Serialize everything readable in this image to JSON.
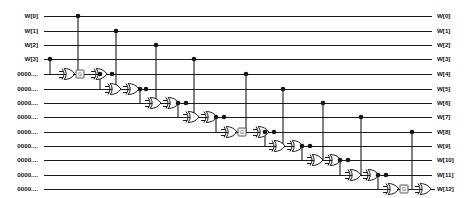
{
  "diagram": {
    "type": "logic-schematic",
    "width": 473,
    "height": 198,
    "colors": {
      "wire": "#1a1a1a",
      "junction": "#141414",
      "gate_fill": "#ffffff",
      "box_fill": "#f2f2f2",
      "box_stroke": "#4a4a4a",
      "background": "#ffffff",
      "text": "#101010"
    }
  },
  "rows": [
    {
      "y": 16,
      "left_label": "W[0]",
      "right_label": "W[0]"
    },
    {
      "y": 31,
      "left_label": "W[1]",
      "right_label": "W[1]"
    },
    {
      "y": 45,
      "left_label": "W[2]",
      "right_label": "W[2]"
    },
    {
      "y": 59,
      "left_label": "W[3]",
      "right_label": "W[3]"
    },
    {
      "y": 74,
      "left_label": "0000....",
      "right_label": "W[4]"
    },
    {
      "y": 89,
      "left_label": "0000....",
      "right_label": "W[5]"
    },
    {
      "y": 103,
      "left_label": "0000....",
      "right_label": "W[6]"
    },
    {
      "y": 117,
      "left_label": "0000....",
      "right_label": "W[7]"
    },
    {
      "y": 132,
      "left_label": "0000....",
      "right_label": "W[8]"
    },
    {
      "y": 146,
      "left_label": "0000....",
      "right_label": "W[9]"
    },
    {
      "y": 160,
      "left_label": "0000....",
      "right_label": "W[10]"
    },
    {
      "y": 175,
      "left_label": "0000....",
      "right_label": "W[11]"
    },
    {
      "y": 189,
      "left_label": "0000....",
      "right_label": "W[12]"
    }
  ],
  "geometry": {
    "label_left_x": 38,
    "wire_left_x": 44,
    "wire_right_x": 432,
    "label_right_x": 437
  },
  "gates": [
    {
      "id": "g1a",
      "x": 62,
      "y": 74,
      "kind": "xor"
    },
    {
      "id": "g1b",
      "x": 94,
      "y": 74,
      "kind": "xor"
    },
    {
      "id": "g2a",
      "x": 108,
      "y": 89,
      "kind": "xor"
    },
    {
      "id": "g2b",
      "x": 126,
      "y": 89,
      "kind": "xor"
    },
    {
      "id": "g3a",
      "x": 148,
      "y": 103,
      "kind": "xor"
    },
    {
      "id": "g3b",
      "x": 166,
      "y": 103,
      "kind": "xor"
    },
    {
      "id": "g4a",
      "x": 186,
      "y": 117,
      "kind": "xor"
    },
    {
      "id": "g4b",
      "x": 204,
      "y": 117,
      "kind": "xor"
    },
    {
      "id": "g5a",
      "x": 224,
      "y": 132,
      "kind": "xor"
    },
    {
      "id": "g5b",
      "x": 256,
      "y": 132,
      "kind": "xor"
    },
    {
      "id": "g6a",
      "x": 272,
      "y": 146,
      "kind": "xor"
    },
    {
      "id": "g6b",
      "x": 290,
      "y": 146,
      "kind": "xor"
    },
    {
      "id": "g7a",
      "x": 310,
      "y": 160,
      "kind": "xor"
    },
    {
      "id": "g7b",
      "x": 328,
      "y": 160,
      "kind": "xor"
    },
    {
      "id": "g8a",
      "x": 348,
      "y": 175,
      "kind": "xor"
    },
    {
      "id": "g8b",
      "x": 366,
      "y": 175,
      "kind": "xor"
    },
    {
      "id": "g9a",
      "x": 386,
      "y": 189,
      "kind": "xor"
    },
    {
      "id": "g9b",
      "x": 418,
      "y": 189,
      "kind": "xor"
    }
  ],
  "boxes": [
    {
      "id": "b1",
      "x": 80,
      "y": 74,
      "label": "G"
    },
    {
      "id": "b2",
      "x": 242,
      "y": 132,
      "label": "G"
    },
    {
      "id": "b3",
      "x": 404,
      "y": 189,
      "label": "G"
    }
  ],
  "taps": [
    {
      "id": "t0",
      "x": 78,
      "from_row_y": 16,
      "to_row_y": 74
    },
    {
      "id": "t1",
      "x": 116,
      "from_row_y": 31,
      "to_row_y": 89
    },
    {
      "id": "t2",
      "x": 156,
      "from_row_y": 45,
      "to_row_y": 103
    },
    {
      "id": "t3",
      "x": 194,
      "from_row_y": 59,
      "to_row_y": 117
    },
    {
      "id": "t4",
      "x": 246,
      "from_row_y": 74,
      "to_row_y": 132
    },
    {
      "id": "t5",
      "x": 283,
      "from_row_y": 89,
      "to_row_y": 146
    },
    {
      "id": "t6",
      "x": 323,
      "from_row_y": 103,
      "to_row_y": 160
    },
    {
      "id": "t7",
      "x": 361,
      "from_row_y": 117,
      "to_row_y": 175
    },
    {
      "id": "t8",
      "x": 412,
      "from_row_y": 132,
      "to_row_y": 189
    }
  ],
  "feedback_taps": [
    {
      "id": "f3",
      "x": 50,
      "from_row_y": 59,
      "to_row_y": 74
    },
    {
      "id": "f4",
      "x": 100,
      "from_row_y": 74,
      "to_row_y": 89
    },
    {
      "id": "f5",
      "x": 140,
      "from_row_y": 89,
      "to_row_y": 103
    },
    {
      "id": "f6",
      "x": 178,
      "from_row_y": 103,
      "to_row_y": 117
    },
    {
      "id": "f7",
      "x": 216,
      "from_row_y": 117,
      "to_row_y": 132
    },
    {
      "id": "f8",
      "x": 265,
      "from_row_y": 132,
      "to_row_y": 146
    },
    {
      "id": "f9",
      "x": 302,
      "from_row_y": 146,
      "to_row_y": 160
    },
    {
      "id": "f10",
      "x": 340,
      "from_row_y": 160,
      "to_row_y": 175
    },
    {
      "id": "f11",
      "x": 378,
      "from_row_y": 175,
      "to_row_y": 189
    }
  ]
}
